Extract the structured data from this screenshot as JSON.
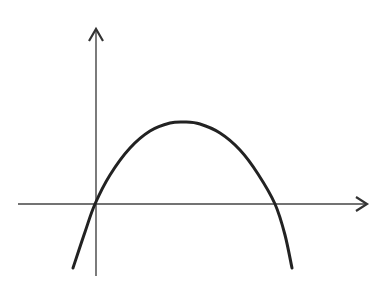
{
  "figure": {
    "label": "(b)",
    "visible_label_fragment": ")"
  },
  "chart_data": {
    "type": "line",
    "title": "",
    "xlabel": "",
    "ylabel": "",
    "x_axis": {
      "from": [
        18,
        204
      ],
      "to": [
        368,
        204
      ],
      "arrow": true
    },
    "y_axis": {
      "from": [
        96,
        276
      ],
      "to": [
        96,
        29
      ],
      "arrow": true
    },
    "origin": [
      95,
      204
    ],
    "curve_points_px": [
      [
        73,
        268
      ],
      [
        85,
        232
      ],
      [
        95,
        204
      ],
      [
        110,
        175
      ],
      [
        130,
        148
      ],
      [
        150,
        131
      ],
      [
        170,
        123
      ],
      [
        185,
        122
      ],
      [
        200,
        124
      ],
      [
        220,
        133
      ],
      [
        240,
        150
      ],
      [
        258,
        174
      ],
      [
        275,
        204
      ],
      [
        285,
        235
      ],
      [
        292,
        268
      ]
    ],
    "features": {
      "x_intercepts_px": [
        95,
        275
      ],
      "maximum_px": [
        185,
        122
      ]
    },
    "grid": false,
    "legend": null
  },
  "colors": {
    "curve": "#222222",
    "axes": "#444444",
    "background": "#ffffff"
  }
}
